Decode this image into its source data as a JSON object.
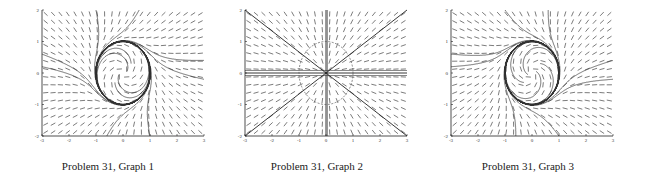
{
  "chart_data": [
    {
      "type": "direction_field",
      "title": "",
      "caption": "Problem 31, Graph 1",
      "xlim": [
        -3,
        3
      ],
      "ylim": [
        -2,
        2
      ],
      "xticks": [
        "-3",
        "-2",
        "-1",
        "0",
        "1",
        "2",
        "3"
      ],
      "yticks": [
        "2",
        "1",
        "0",
        "-1",
        "-2"
      ],
      "field": "limit_cycle_ccw",
      "limit_cycle": "unit circle",
      "frame": {
        "x0": 42,
        "y0": 10,
        "x1": 204,
        "y1": 136
      }
    },
    {
      "type": "direction_field",
      "title": "",
      "caption": "Problem 31, Graph 2",
      "xlim": [
        -3,
        3
      ],
      "ylim": [
        -2,
        2
      ],
      "xticks": [
        "-3",
        "-2",
        "-1",
        "0",
        "1",
        "2",
        "3"
      ],
      "yticks": [
        "2",
        "1",
        "0",
        "-1",
        "-2"
      ],
      "field": "radial",
      "limit_cycle": "dashed unit circle",
      "frame": {
        "x0": 36,
        "y0": 10,
        "x1": 198,
        "y1": 136
      }
    },
    {
      "type": "direction_field",
      "title": "",
      "caption": "Problem 31, Graph 3",
      "xlim": [
        -3,
        3
      ],
      "ylim": [
        -2,
        2
      ],
      "xticks": [
        "-3",
        "-2",
        "-1",
        "0",
        "1",
        "2",
        "3"
      ],
      "yticks": [
        "2",
        "1",
        "0",
        "-1",
        "-2"
      ],
      "field": "limit_cycle_cw",
      "limit_cycle": "unit circle",
      "frame": {
        "x0": 31,
        "y0": 10,
        "x1": 193,
        "y1": 136
      }
    }
  ],
  "captions": [
    "Problem 31, Graph 1",
    "Problem 31, Graph 2",
    "Problem 31, Graph 3"
  ]
}
